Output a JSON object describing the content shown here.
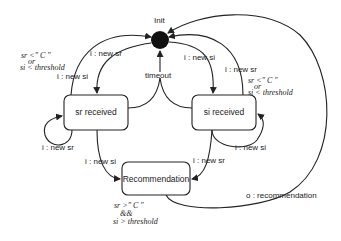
{
  "diagram": {
    "type": "state-machine",
    "initial_state": {
      "label": "Init"
    },
    "states": [
      {
        "id": "sr_received",
        "label": "sr received"
      },
      {
        "id": "si_received",
        "label": "si received"
      },
      {
        "id": "recommendation",
        "label": "Recommendation"
      }
    ],
    "transitions": [
      {
        "from": "init",
        "to": "sr_received",
        "label": "i : new sr"
      },
      {
        "from": "init",
        "to": "si_received",
        "label": "i : new si"
      },
      {
        "from": "sr_received",
        "to": "init",
        "label": "i : new si",
        "guard": [
          "sr <\" C \"",
          "or",
          "si < threshold"
        ]
      },
      {
        "from": "si_received",
        "to": "init",
        "label": "i : new sr",
        "guard": [
          "sr <\" C \"",
          "or",
          "si < threshold"
        ]
      },
      {
        "from": "sr_received",
        "to": "sr_received",
        "label": "i : new sr"
      },
      {
        "from": "si_received",
        "to": "si_received",
        "label": "i : new si"
      },
      {
        "from": "sr_received",
        "to": "init",
        "label": "timeout"
      },
      {
        "from": "si_received",
        "to": "init",
        "label": "timeout"
      },
      {
        "from": "sr_received",
        "to": "recommendation",
        "label": "i : new si"
      },
      {
        "from": "si_received",
        "to": "recommendation",
        "label": "i : new sr"
      },
      {
        "from": "recommendation",
        "to": "init",
        "label": "o : recommendation",
        "guard": [
          "sr >\" C \"",
          "&&",
          "si > threshold"
        ]
      }
    ]
  },
  "labels": {
    "init": "Init",
    "timeout": "timeout",
    "sr_recv_new_si_out": "i : new si",
    "init_to_sr": "i : new sr",
    "init_to_si": "i : new si",
    "si_recv_new_sr_out": "i : new sr",
    "sr_self": "i : new sr",
    "si_self": "i : new si",
    "sr_to_rec": "i : new si",
    "si_to_rec": "i : new sr",
    "rec_out": "o : recommendation",
    "guard_left": {
      "l1": "sr <\" C \"",
      "l2": "or",
      "l3": "si < threshold"
    },
    "guard_right": {
      "l1": "sr <\" C \"",
      "l2": "or",
      "l3": "si < threshold"
    },
    "guard_rec": {
      "l1": "sr >\" C \"",
      "l2": "&&",
      "l3": "si > threshold"
    }
  }
}
